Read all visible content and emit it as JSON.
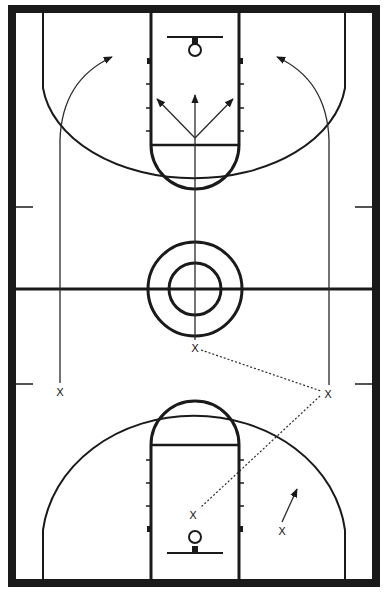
{
  "diagram": {
    "type": "basketball-full-court-play",
    "colors": {
      "line": "#1a1a1a",
      "background": "#ffffff",
      "border": "#1a1a1a"
    },
    "players": [
      {
        "id": "p1",
        "label": "X",
        "x": 195,
        "y": 348,
        "role": "top-of-key"
      },
      {
        "id": "p2",
        "label": "X",
        "x": 60,
        "y": 392,
        "role": "left-wing"
      },
      {
        "id": "p3",
        "label": "X",
        "x": 328,
        "y": 394,
        "role": "right-wing"
      },
      {
        "id": "p4",
        "label": "X",
        "x": 193,
        "y": 515,
        "role": "low-post"
      },
      {
        "id": "p5",
        "label": "X",
        "x": 282,
        "y": 531,
        "role": "right-block"
      }
    ],
    "movements": [
      {
        "type": "cut",
        "from": "p2",
        "description": "left wing sprints up sideline, curves toward far basket"
      },
      {
        "type": "cut",
        "from": "p3",
        "description": "right wing sprints up sideline, curves toward far basket"
      },
      {
        "type": "cut",
        "from": "p1",
        "description": "top player runs up middle to far free-throw line, fans out three options"
      },
      {
        "type": "pass",
        "from": "p1",
        "to": "p3"
      },
      {
        "type": "pass",
        "from": "p3",
        "to": "p4"
      },
      {
        "type": "cut",
        "from": "p5",
        "description": "short move toward right elbow"
      }
    ]
  }
}
